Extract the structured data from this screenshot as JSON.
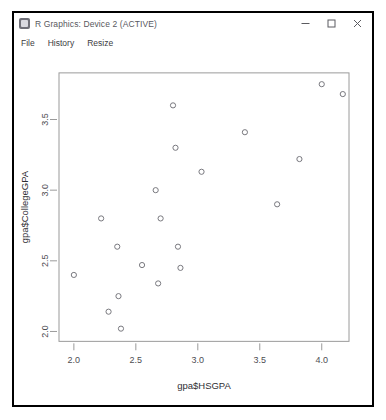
{
  "window": {
    "title": "R Graphics: Device 2 (ACTIVE)",
    "app_icon": "r-graphics-icon",
    "controls": {
      "minimize": "—",
      "maximize": "☐",
      "close": "✕"
    }
  },
  "menu": {
    "items": [
      {
        "label": "File"
      },
      {
        "label": "History"
      },
      {
        "label": "Resize"
      }
    ]
  },
  "chart_data": {
    "type": "scatter",
    "title": "",
    "xlabel": "gpa$HSGPA",
    "ylabel": "gpa$CollegeGPA",
    "xlim": [
      1.88,
      4.22
    ],
    "ylim": [
      1.93,
      3.83
    ],
    "xticks": [
      "2.0",
      "2.5",
      "3.0",
      "3.5",
      "4.0"
    ],
    "xtick_values": [
      2.0,
      2.5,
      3.0,
      3.5,
      4.0
    ],
    "yticks": [
      "2.0",
      "2.5",
      "3.0",
      "3.5"
    ],
    "ytick_values": [
      2.0,
      2.5,
      3.0,
      3.5
    ],
    "grid": false,
    "legend": "none",
    "point_symbol": "open-circle",
    "point_color": "#77777d",
    "n_points": 20,
    "points": [
      {
        "x": 2.0,
        "y": 2.4
      },
      {
        "x": 2.22,
        "y": 2.8
      },
      {
        "x": 2.28,
        "y": 2.14
      },
      {
        "x": 2.35,
        "y": 2.6
      },
      {
        "x": 2.36,
        "y": 2.25
      },
      {
        "x": 2.38,
        "y": 2.02
      },
      {
        "x": 2.55,
        "y": 2.47
      },
      {
        "x": 2.66,
        "y": 3.0
      },
      {
        "x": 2.68,
        "y": 2.34
      },
      {
        "x": 2.7,
        "y": 2.8
      },
      {
        "x": 2.8,
        "y": 3.6
      },
      {
        "x": 2.82,
        "y": 3.3
      },
      {
        "x": 2.84,
        "y": 2.6
      },
      {
        "x": 2.86,
        "y": 2.45
      },
      {
        "x": 3.03,
        "y": 3.13
      },
      {
        "x": 3.38,
        "y": 3.41
      },
      {
        "x": 3.64,
        "y": 2.9
      },
      {
        "x": 3.82,
        "y": 3.22
      },
      {
        "x": 4.0,
        "y": 3.75
      },
      {
        "x": 4.17,
        "y": 3.68
      }
    ]
  }
}
